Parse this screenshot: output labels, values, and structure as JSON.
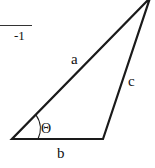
{
  "formula_fragment": {
    "text": "-1"
  },
  "triangle": {
    "vertices": {
      "top": [
        150,
        0
      ],
      "bottom_left": [
        12,
        139
      ],
      "bottom_right": [
        103,
        139
      ]
    },
    "side_labels": {
      "a": "a",
      "b": "b",
      "c": "c"
    },
    "angle_label": "Θ",
    "stroke_color": "#1a1a1a"
  }
}
